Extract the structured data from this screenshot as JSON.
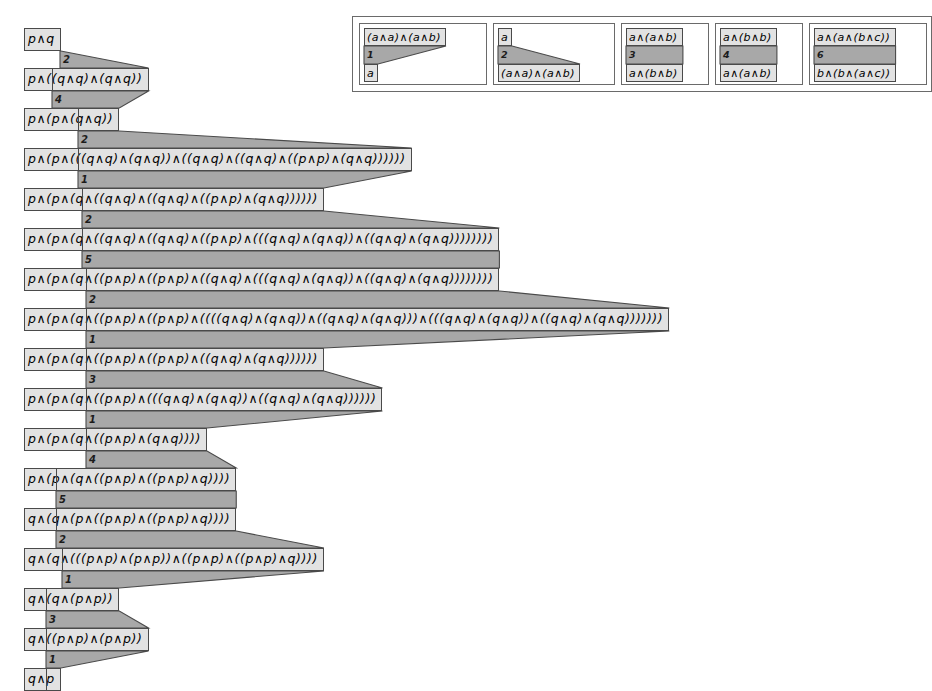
{
  "legend": {
    "name": "rewrite-rule-legend",
    "rules": [
      {
        "id": "rule-1",
        "number": "1",
        "top": "(a∧a)∧(a∧b)",
        "bottom": "a",
        "shape": "narrowing"
      },
      {
        "id": "rule-2",
        "number": "2",
        "top": "a",
        "bottom": "(a∧a)∧(a∧b)",
        "shape": "widening"
      },
      {
        "id": "rule-3",
        "number": "3",
        "top": "a∧(a∧b)",
        "bottom": "a∧(b∧b)",
        "shape": "equal"
      },
      {
        "id": "rule-4",
        "number": "4",
        "top": "a∧(b∧b)",
        "bottom": "a∧(a∧b)",
        "shape": "equal"
      },
      {
        "id": "rule-6",
        "number": "6",
        "top": "a∧(a∧(b∧c))",
        "bottom": "b∧(b∧(a∧c))",
        "shape": "equal"
      }
    ]
  },
  "derivation": {
    "name": "derivation-sequence",
    "rows": [
      {
        "index": 0,
        "formula": "p∧q"
      },
      {
        "index": 1,
        "formula": "p∧((q∧q)∧(q∧q))"
      },
      {
        "index": 2,
        "formula": "p∧(p∧(q∧q))"
      },
      {
        "index": 3,
        "formula": "p∧(p∧(((q∧q)∧(q∧q))∧((q∧q)∧((q∧q)∧((p∧p)∧(q∧q))))))"
      },
      {
        "index": 4,
        "formula": "p∧(p∧(q∧((q∧q)∧((q∧q)∧((p∧p)∧(q∧q))))))"
      },
      {
        "index": 5,
        "formula": "p∧(p∧(q∧((q∧q)∧((q∧q)∧((p∧p)∧(((q∧q)∧(q∧q))∧((q∧q)∧(q∧q))))))))"
      },
      {
        "index": 6,
        "formula": "p∧(p∧(q∧((p∧p)∧((p∧p)∧((q∧q)∧(((q∧q)∧(q∧q))∧((q∧q)∧(q∧q))))))))"
      },
      {
        "index": 7,
        "formula": "p∧(p∧(q∧((p∧p)∧((p∧p)∧((((q∧q)∧(q∧q))∧((q∧q)∧(q∧q)))∧(((q∧q)∧(q∧q))∧((q∧q)∧(q∧q)))))))"
      },
      {
        "index": 8,
        "formula": "p∧(p∧(q∧((p∧p)∧((p∧p)∧((q∧q)∧(q∧q))))))"
      },
      {
        "index": 9,
        "formula": "p∧(p∧(q∧((p∧p)∧(((q∧q)∧(q∧q))∧((q∧q)∧(q∧q))))))"
      },
      {
        "index": 10,
        "formula": "p∧(p∧(q∧((p∧p)∧(q∧q))))"
      },
      {
        "index": 11,
        "formula": "p∧(p∧(q∧((p∧p)∧((p∧p)∧q))))"
      },
      {
        "index": 12,
        "formula": "q∧(q∧(p∧((p∧p)∧((p∧p)∧q))))"
      },
      {
        "index": 13,
        "formula": "q∧(q∧(((p∧p)∧(p∧p))∧((p∧p)∧((p∧p)∧q))))"
      },
      {
        "index": 14,
        "formula": "q∧(q∧(p∧p))"
      },
      {
        "index": 15,
        "formula": "q∧((p∧p)∧(p∧p))"
      },
      {
        "index": 16,
        "formula": "q∧p"
      }
    ],
    "steps": [
      {
        "from": 0,
        "to": 1,
        "number": "2"
      },
      {
        "from": 1,
        "to": 2,
        "number": "4"
      },
      {
        "from": 2,
        "to": 3,
        "number": "2"
      },
      {
        "from": 3,
        "to": 4,
        "number": "1"
      },
      {
        "from": 4,
        "to": 5,
        "number": "2"
      },
      {
        "from": 5,
        "to": 6,
        "number": "5"
      },
      {
        "from": 6,
        "to": 7,
        "number": "2"
      },
      {
        "from": 7,
        "to": 8,
        "number": "1"
      },
      {
        "from": 8,
        "to": 9,
        "number": "3"
      },
      {
        "from": 9,
        "to": 10,
        "number": "1"
      },
      {
        "from": 10,
        "to": 11,
        "number": "4"
      },
      {
        "from": 11,
        "to": 12,
        "number": "5"
      },
      {
        "from": 12,
        "to": 13,
        "number": "2"
      },
      {
        "from": 13,
        "to": 14,
        "number": "1"
      },
      {
        "from": 14,
        "to": 15,
        "number": "3"
      },
      {
        "from": 15,
        "to": 16,
        "number": "1"
      }
    ]
  },
  "colors": {
    "box_fill": "#e2e2e2",
    "band_fill": "#a8a8a8",
    "stroke": "#4a4a4a",
    "page_bg": "#ffffff"
  }
}
